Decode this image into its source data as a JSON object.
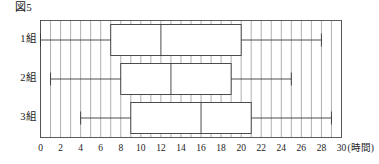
{
  "figure": {
    "caption": "図5"
  },
  "chart_data": {
    "type": "box",
    "title": "図5",
    "xlabel": "(時間)",
    "ylabel": "",
    "xlim": [
      0,
      30
    ],
    "xticks": [
      0,
      2,
      4,
      6,
      8,
      10,
      12,
      14,
      16,
      18,
      20,
      22,
      24,
      26,
      28,
      30
    ],
    "xtick_labels": [
      "0",
      "2",
      "4",
      "6",
      "8",
      "10",
      "12",
      "14",
      "16",
      "18",
      "20",
      "22",
      "24",
      "26",
      "28",
      "30"
    ],
    "unit_label": "(時間)",
    "grid": true,
    "grid_step": 1,
    "legend": "none",
    "categories": [
      "1組",
      "2組",
      "3組"
    ],
    "boxes": [
      {
        "label": "1組",
        "min": 0,
        "q1": 7,
        "median": 12,
        "q3": 20,
        "max": 28
      },
      {
        "label": "2組",
        "min": 1,
        "q1": 8,
        "median": 13,
        "q3": 19,
        "max": 25
      },
      {
        "label": "3組",
        "min": 4,
        "q1": 9,
        "median": 16,
        "q3": 21,
        "max": 29
      }
    ]
  },
  "colors": {
    "box_stroke": "#3a3a3a",
    "grid": "#8e8e8e",
    "frame": "#4a4a4a",
    "text": "#1a1a1a",
    "background": "#ffffff"
  }
}
